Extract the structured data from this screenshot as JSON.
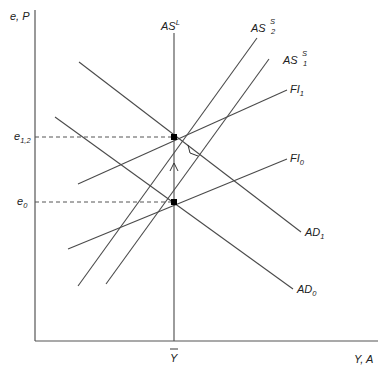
{
  "diagram": {
    "axes": {
      "y_label": "e, P",
      "x_label": "Y, A",
      "x_tick_label": "Y"
    },
    "y_levels": [
      {
        "name": "e_12",
        "base": "e",
        "sub": "1,2"
      },
      {
        "name": "e_0",
        "base": "e",
        "sub": "0"
      }
    ],
    "curves": {
      "AS_L": {
        "base": "AS",
        "sup": "L"
      },
      "AS_S2": {
        "base": "AS",
        "sup": "S",
        "sub": "2"
      },
      "AS_S1": {
        "base": "AS",
        "sup": "S",
        "sub": "1"
      },
      "FI_1": {
        "base": "FI",
        "sub": "1"
      },
      "FI_0": {
        "base": "FI",
        "sub": "0"
      },
      "AD_1": {
        "base": "AD",
        "sub": "1"
      },
      "AD_0": {
        "base": "AD",
        "sub": "0"
      }
    },
    "equilibria": [
      {
        "name": "initial",
        "level": "e_0",
        "x_at": "Y-bar"
      },
      {
        "name": "final",
        "level": "e_12",
        "x_at": "Y-bar"
      }
    ],
    "colors": {
      "line": "#4a4a4a",
      "point": "#000000",
      "background": "#ffffff"
    }
  }
}
